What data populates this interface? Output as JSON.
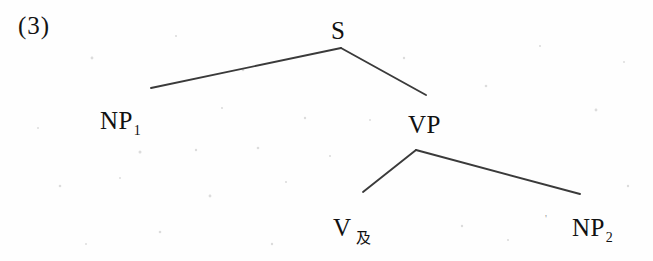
{
  "figure": {
    "example_number": "(3)",
    "type": "syntax-tree"
  },
  "tree": {
    "nodes": [
      {
        "id": "s",
        "label": "S",
        "subscript": "",
        "x": 341,
        "y": 42
      },
      {
        "id": "np1",
        "label": "NP",
        "subscript": "1",
        "x": 125,
        "y": 128
      },
      {
        "id": "vp",
        "label": "VP",
        "subscript": "",
        "x": 427,
        "y": 135
      },
      {
        "id": "v",
        "label": "V",
        "subscript": "及",
        "x": 352,
        "y": 235
      },
      {
        "id": "np2",
        "label": "NP",
        "subscript": "2",
        "x": 598,
        "y": 235
      }
    ],
    "edges": [
      {
        "from": "s",
        "to": "np1",
        "x1": 341,
        "y1": 48,
        "x2": 151,
        "y2": 88
      },
      {
        "from": "s",
        "to": "vp",
        "x1": 341,
        "y1": 48,
        "x2": 426,
        "y2": 95
      },
      {
        "from": "vp",
        "to": "v",
        "x1": 416,
        "y1": 150,
        "x2": 363,
        "y2": 192
      },
      {
        "from": "vp",
        "to": "np2",
        "x1": 416,
        "y1": 150,
        "x2": 580,
        "y2": 194
      }
    ]
  },
  "colors": {
    "line": "#3a3a3a",
    "text": "#111111",
    "background": "#fefefe",
    "speckle": "#d8d8d8"
  },
  "artifacts": {
    "stray_mark": "'"
  }
}
